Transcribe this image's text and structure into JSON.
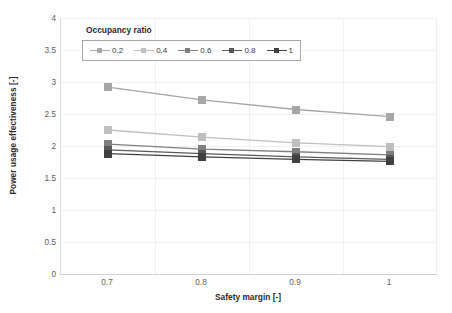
{
  "chart_data": {
    "type": "line",
    "title": "",
    "xlabel": "Safety margin [-]",
    "ylabel": "Power usage effectiveness [-]",
    "x": [
      0.7,
      0.8,
      0.9,
      1
    ],
    "xticklabels": [
      "0.7",
      "0.8",
      "0.9",
      "1"
    ],
    "yticklabels": [
      "0",
      "0.5",
      "1",
      "1.5",
      "2",
      "2.5",
      "3",
      "3.5",
      "4"
    ],
    "ylim": [
      0,
      4
    ],
    "ytick_step": 0.5,
    "grid": true,
    "legend_position": "top-left-inside",
    "legend_title": "Occupancy ratio",
    "series": [
      {
        "name": "0.2",
        "values": [
          2.92,
          2.72,
          2.57,
          2.46
        ],
        "color": "#a6a6a6"
      },
      {
        "name": "0.4",
        "values": [
          2.25,
          2.14,
          2.05,
          1.99
        ],
        "color": "#bfbfbf"
      },
      {
        "name": "0.6",
        "values": [
          2.03,
          1.95,
          1.91,
          1.86
        ],
        "color": "#7f7f7f"
      },
      {
        "name": "0.8",
        "values": [
          1.94,
          1.88,
          1.83,
          1.79
        ],
        "color": "#595959"
      },
      {
        "name": "1",
        "values": [
          1.88,
          1.83,
          1.79,
          1.76
        ],
        "color": "#404040"
      }
    ]
  },
  "axes": {
    "y_title": "Power usage effectiveness [-]",
    "x_title": "Safety margin [-]"
  },
  "legend": {
    "title": "Occupancy ratio",
    "items": [
      {
        "label": "0.2"
      },
      {
        "label": "0.4"
      },
      {
        "label": "0.6"
      },
      {
        "label": "0.8"
      },
      {
        "label": "1"
      }
    ]
  },
  "colors": {
    "gridline": "#f1f1f1",
    "axis": "#d9d9d9",
    "tick_text": "#5e5e5e",
    "title_text": "#2b2b2b",
    "legend_border": "#a6a6a6",
    "background": "#ffffff"
  }
}
